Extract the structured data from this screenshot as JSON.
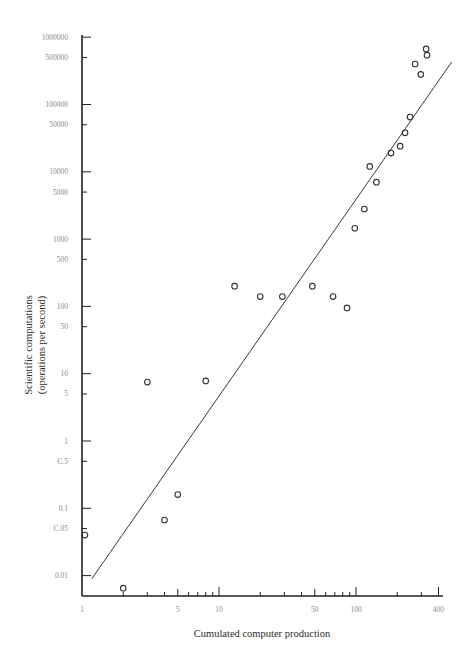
{
  "chart_data": {
    "type": "scatter",
    "title": "",
    "xlabel": "Cumulated computer production",
    "ylabel": "Scientific computations (operations per second)",
    "ylabel_lines": [
      "Scientific computations",
      "(operations per second)"
    ],
    "xscale": "log",
    "yscale": "log",
    "xlim": [
      1,
      450
    ],
    "ylim": [
      0.005,
      1000000
    ],
    "grid": false,
    "legend": null,
    "x_ticks": [
      {
        "value": 1,
        "label": "1",
        "major": true
      },
      {
        "value": 2,
        "label": "",
        "major": false
      },
      {
        "value": 3,
        "label": "",
        "major": false
      },
      {
        "value": 4,
        "label": "",
        "major": false
      },
      {
        "value": 5,
        "label": "5",
        "major": true
      },
      {
        "value": 6,
        "label": "",
        "major": false
      },
      {
        "value": 7,
        "label": "",
        "major": false
      },
      {
        "value": 8,
        "label": "",
        "major": false
      },
      {
        "value": 9,
        "label": "",
        "major": false
      },
      {
        "value": 10,
        "label": "10",
        "major": true
      },
      {
        "value": 20,
        "label": "",
        "major": false
      },
      {
        "value": 30,
        "label": "",
        "major": false
      },
      {
        "value": 40,
        "label": "",
        "major": false
      },
      {
        "value": 50,
        "label": "50",
        "major": true
      },
      {
        "value": 60,
        "label": "",
        "major": false
      },
      {
        "value": 70,
        "label": "",
        "major": false
      },
      {
        "value": 80,
        "label": "",
        "major": false
      },
      {
        "value": 90,
        "label": "",
        "major": false
      },
      {
        "value": 100,
        "label": "100",
        "major": true
      },
      {
        "value": 200,
        "label": "",
        "major": false
      },
      {
        "value": 300,
        "label": "",
        "major": false
      },
      {
        "value": 400,
        "label": "400",
        "major": true
      }
    ],
    "y_ticks": [
      {
        "value": 1000000,
        "label": "1000000",
        "major": true
      },
      {
        "value": 500000,
        "label": "500000",
        "major": false
      },
      {
        "value": 100000,
        "label": "100000",
        "major": true
      },
      {
        "value": 50000,
        "label": "50000",
        "major": false
      },
      {
        "value": 10000,
        "label": "10000",
        "major": true
      },
      {
        "value": 5000,
        "label": "5000",
        "major": false
      },
      {
        "value": 1000,
        "label": "1000",
        "major": true
      },
      {
        "value": 500,
        "label": "500",
        "major": false
      },
      {
        "value": 100,
        "label": "100",
        "major": true
      },
      {
        "value": 50,
        "label": "50",
        "major": false
      },
      {
        "value": 10,
        "label": "10",
        "major": true
      },
      {
        "value": 5,
        "label": "5",
        "major": false
      },
      {
        "value": 1,
        "label": "1",
        "major": true
      },
      {
        "value": 0.5,
        "label": "C.5",
        "major": false
      },
      {
        "value": 0.1,
        "label": "0.1",
        "major": true
      },
      {
        "value": 0.05,
        "label": "C.05",
        "major": false
      },
      {
        "value": 0.01,
        "label": "0.01",
        "major": true
      }
    ],
    "series": [
      {
        "name": "observations",
        "marker": "open-circle",
        "points": [
          {
            "x": 1.05,
            "y": 0.04
          },
          {
            "x": 2,
            "y": 0.0065
          },
          {
            "x": 3,
            "y": 7.5
          },
          {
            "x": 4,
            "y": 0.067
          },
          {
            "x": 5,
            "y": 0.16
          },
          {
            "x": 8,
            "y": 7.8
          },
          {
            "x": 13,
            "y": 200
          },
          {
            "x": 20,
            "y": 140
          },
          {
            "x": 29,
            "y": 140
          },
          {
            "x": 48,
            "y": 200
          },
          {
            "x": 68,
            "y": 140
          },
          {
            "x": 86,
            "y": 95
          },
          {
            "x": 98,
            "y": 1450
          },
          {
            "x": 115,
            "y": 2800
          },
          {
            "x": 126,
            "y": 12000
          },
          {
            "x": 141,
            "y": 7000
          },
          {
            "x": 180,
            "y": 19000
          },
          {
            "x": 210,
            "y": 24000
          },
          {
            "x": 228,
            "y": 38000
          },
          {
            "x": 248,
            "y": 65000
          },
          {
            "x": 270,
            "y": 400000
          },
          {
            "x": 297,
            "y": 280000
          },
          {
            "x": 325,
            "y": 670000
          },
          {
            "x": 330,
            "y": 540000
          }
        ]
      },
      {
        "name": "trend line",
        "marker": "line",
        "points": [
          {
            "x": 1.18,
            "y": 0.009
          },
          {
            "x": 500,
            "y": 430000
          }
        ]
      }
    ]
  }
}
